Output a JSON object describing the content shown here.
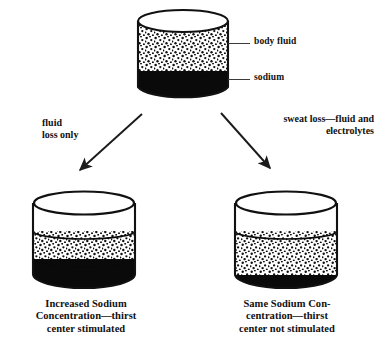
{
  "diagram": {
    "ink_color": "#111111",
    "fluid_color": "#ffffff",
    "sodium_color": "#0a0a0a"
  },
  "top_container": {
    "name": "body fluid compartment",
    "fluid_label": "body fluid",
    "sodium_label": "sodium",
    "fluid_fraction": 0.66,
    "sodium_fraction": 0.34,
    "empty_fraction": 0.0
  },
  "branches": [
    {
      "id": "left",
      "label_line1": "fluid",
      "label_line2": "loss only",
      "label": "fluid loss only",
      "direction": "down-left"
    },
    {
      "id": "right",
      "label_line1": "sweat loss—fluid and",
      "label_line2": "electrolytes",
      "label": "sweat loss—fluid and electrolytes",
      "direction": "down-right"
    }
  ],
  "bottom_containers": [
    {
      "id": "left",
      "empty_fraction": 0.33,
      "fluid_fraction": 0.33,
      "sodium_fraction": 0.34,
      "caption_line1": "Increased Sodium",
      "caption_line2": "Concentration—thirst",
      "caption_line3": "center stimulated",
      "caption": "Increased Sodium Concentration—thirst center stimulated"
    },
    {
      "id": "right",
      "empty_fraction": 0.33,
      "fluid_fraction": 0.52,
      "sodium_fraction": 0.15,
      "caption_line1": "Same Sodium Con-",
      "caption_line2": "centration—thirst",
      "caption_line3": "center not stimulated",
      "caption": "Same Sodium Concentration—thirst center not stimulated"
    }
  ]
}
